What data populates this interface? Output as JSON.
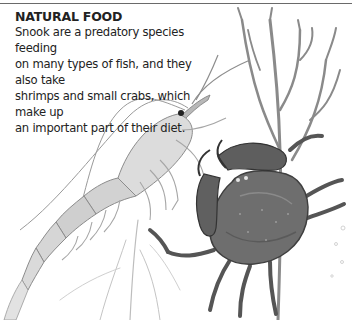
{
  "section": {
    "heading": "NATURAL FOOD",
    "lines": [
      "Snook are a predatory species feeding",
      "on many types of fish, and they also take",
      "shrimps and small crabs, which make up",
      "an important part of their diet."
    ]
  },
  "illustrations": {
    "shrimp": "shrimp-illustration",
    "crab": "crab-illustration",
    "seaweed": "seaweed-illustration"
  },
  "colors": {
    "text": "#222222",
    "rule": "#6a6a6a",
    "crab_shell": "#6e6e6e",
    "shrimp_body": "#d8d8d8",
    "weed": "#8a8a8a"
  }
}
